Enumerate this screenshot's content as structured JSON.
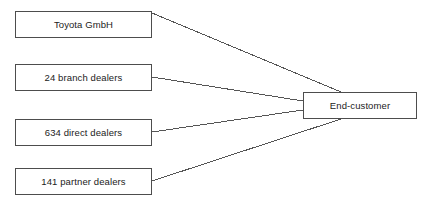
{
  "diagram": {
    "type": "flow-diagram",
    "background_color": "#ffffff",
    "node_border_color": "#4d4d4d",
    "node_fill_color": "#ffffff",
    "connector_color": "#555555",
    "text_color": "#222222",
    "sources": [
      {
        "id": "toyota",
        "label": "Toyota GmbH",
        "x": 15,
        "y": 11,
        "width": 137,
        "height": 27
      },
      {
        "id": "branch",
        "label": "24 branch dealers",
        "count": 24,
        "x": 15,
        "y": 64,
        "width": 137,
        "height": 27
      },
      {
        "id": "direct",
        "label": "634 direct dealers",
        "count": 634,
        "x": 15,
        "y": 119,
        "width": 137,
        "height": 27
      },
      {
        "id": "partner",
        "label": "141 partner dealers",
        "count": 141,
        "x": 15,
        "y": 168,
        "width": 137,
        "height": 27
      }
    ],
    "target": {
      "id": "endcustomer",
      "label": "End-customer",
      "x": 303,
      "y": 92,
      "width": 114,
      "height": 27
    },
    "connectors": [
      {
        "id": "toyota-to-endcustomer",
        "from": "toyota",
        "to": "endcustomer",
        "x1": 152,
        "y1": 13,
        "x2": 341,
        "y2": 92
      },
      {
        "id": "branch-to-endcustomer",
        "from": "branch",
        "to": "endcustomer",
        "x1": 152,
        "y1": 77,
        "x2": 303,
        "y2": 101
      },
      {
        "id": "direct-to-endcustomer",
        "from": "direct",
        "to": "endcustomer",
        "x1": 152,
        "y1": 132,
        "x2": 303,
        "y2": 110
      },
      {
        "id": "partner-to-endcustomer",
        "from": "partner",
        "to": "endcustomer",
        "x1": 152,
        "y1": 181,
        "x2": 341,
        "y2": 119
      }
    ]
  }
}
